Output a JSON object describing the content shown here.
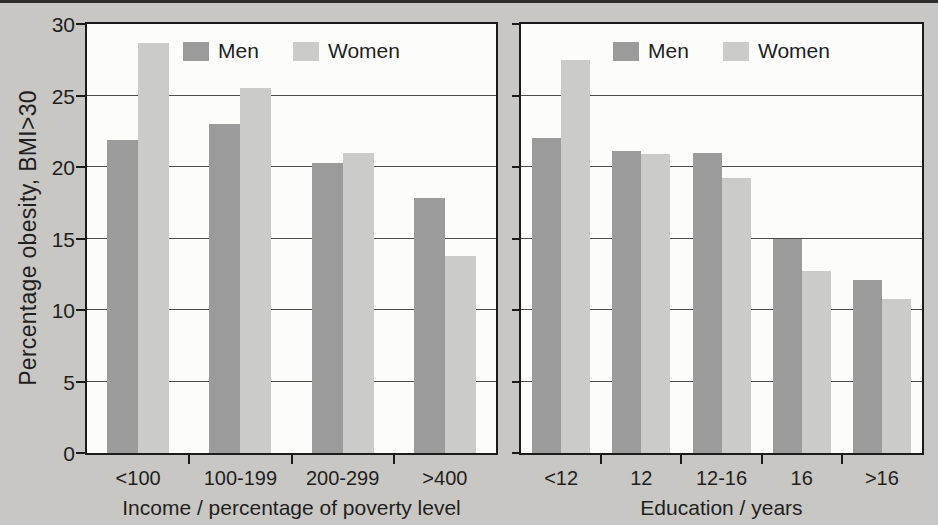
{
  "figure": {
    "background_color": "#c9c7c3",
    "plot_background_color": "#fcfcfb",
    "men_color": "#9b9b9b",
    "women_color": "#cbcbca",
    "axis_color": "#1b1b1b",
    "gridline_color": "#4c4c4c"
  },
  "legend": {
    "men_label": "Men",
    "women_label": "Women"
  },
  "chart_data": [
    {
      "type": "bar",
      "categories": [
        "<100",
        "100-199",
        "200-299",
        ">400"
      ],
      "series": [
        {
          "name": "Men",
          "values": [
            21.9,
            23.0,
            20.3,
            17.8
          ]
        },
        {
          "name": "Women",
          "values": [
            28.7,
            25.5,
            21.0,
            13.8
          ]
        }
      ],
      "title": "",
      "xlabel": "Income / percentage of poverty level",
      "ylabel": "Percentage obesity, BMI>30",
      "ylim": [
        0,
        30
      ],
      "yticks": [
        0,
        5,
        10,
        15,
        20,
        25,
        30
      ],
      "grid": true,
      "legend_position": "top-center"
    },
    {
      "type": "bar",
      "categories": [
        "<12",
        "12",
        "12-16",
        "16",
        ">16"
      ],
      "series": [
        {
          "name": "Men",
          "values": [
            22.0,
            21.1,
            21.0,
            15.0,
            12.1
          ]
        },
        {
          "name": "Women",
          "values": [
            27.5,
            20.9,
            19.2,
            12.7,
            10.8
          ]
        }
      ],
      "title": "",
      "xlabel": "Education / years",
      "ylabel": "",
      "ylim": [
        0,
        30
      ],
      "yticks": [
        0,
        5,
        10,
        15,
        20,
        25,
        30
      ],
      "grid": true,
      "legend_position": "top-center"
    }
  ]
}
